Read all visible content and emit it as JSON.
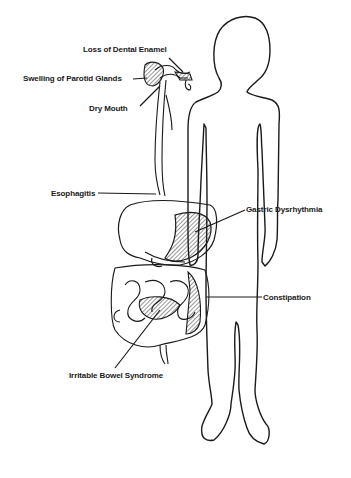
{
  "diagram": {
    "type": "anatomical-illustration",
    "line_color": "#1a1a1a",
    "background": "#ffffff",
    "labels": [
      {
        "id": "dental",
        "text": "Loss of Dental Enamel"
      },
      {
        "id": "parotid",
        "text": "Swelling of Parotid Glands"
      },
      {
        "id": "drymouth",
        "text": "Dry Mouth"
      },
      {
        "id": "esophagitis",
        "text": "Esophagitis"
      },
      {
        "id": "gastric",
        "text": "Gastric Dysrhythmia"
      },
      {
        "id": "constipation",
        "text": "Constipation"
      },
      {
        "id": "ibs",
        "text": "Irritable Bowel Syndrome"
      }
    ]
  }
}
